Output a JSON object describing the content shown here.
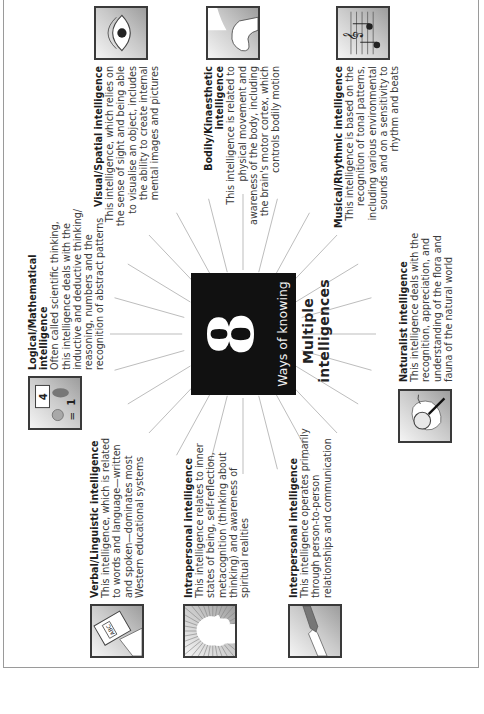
{
  "center": {
    "number": "8",
    "subtitle": "Ways of knowing",
    "title": "Multiple intelligences"
  },
  "intelligences": {
    "logical": {
      "icon": "numbers-shapes-icon",
      "title": "Logical/Mathematical intelligence",
      "lines": [
        "Often called scientific thinking,",
        "this intelligence deals with the",
        "inductive and deductive thinking/",
        "reasoning, numbers and the",
        "recognition of abstract patterns"
      ]
    },
    "visual": {
      "icon": "eye-icon",
      "title": "Visual/Spatial intelligence",
      "lines": [
        "This intelligence, which relies on",
        "the sense of sight and being able",
        "to visualise an object, includes",
        "the ability to create internal",
        "mental images and pictures"
      ]
    },
    "bodily": {
      "icon": "flexed-arm-icon",
      "title": "Bodily/Kinaesthetic intelligence",
      "lines": [
        "This intelligence is related to",
        "physical movement and",
        "awareness of the body, including",
        "the brain's motor cortex, which",
        "controls bodily motion"
      ]
    },
    "musical": {
      "icon": "music-notes-icon",
      "title": "Musical/Rhythmic intelligence",
      "lines": [
        "This intelligence is based on the",
        "recognition of tonal patterns,",
        "including various environmental",
        "sounds and on a sensitivity to",
        "rhythm and beats"
      ]
    },
    "verbal": {
      "icon": "book-abc-icon",
      "title": "Verbal/Linguistic intelligence",
      "lines": [
        "This intelligence, which is related",
        "to words and language—written",
        "and spoken—dominates most",
        "Western educational systems"
      ]
    },
    "intrapersonal": {
      "icon": "head-silhouette-icon",
      "title": "Intrapersonal intelligence",
      "lines": [
        "This intelligence relates to inner",
        "states of being, self-reflection,",
        "metacognition (thinking about",
        "thinking) and awareness of",
        "spiritual realities"
      ]
    },
    "interpersonal": {
      "icon": "handshake-icon",
      "title": "Interpersonal intelligence",
      "lines": [
        "This intelligence operates primarily",
        "through person-to-person",
        "relationships and communication"
      ]
    },
    "naturalist": {
      "icon": "magnifier-leaf-icon",
      "title": "Naturalist intelligence",
      "lines": [
        "This intelligence deals with the",
        "recognition, appreciation, and",
        "understanding of the flora and",
        "fauna of the natural world"
      ]
    }
  },
  "colors": {
    "center_box": "#111111",
    "ray": "#bdbdbd",
    "frame": "#9a9a9a",
    "icon_border": "#3a3a3a"
  }
}
